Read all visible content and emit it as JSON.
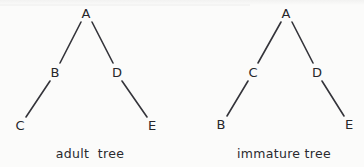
{
  "figure": {
    "background_color": "#fbfbfa",
    "ink_color": "#34343a",
    "text_color": "#26262a",
    "width": 364,
    "height": 167
  },
  "chart_data": {
    "type": "diagram",
    "diagram_kind": "binary-tree-pair",
    "title": "",
    "subtitle": "",
    "xlabel": "",
    "ylabel": "",
    "grid": false,
    "legend_position": "none",
    "panels": [
      {
        "id": "adult-tree",
        "caption": "adult  tree",
        "caption_x": 90,
        "caption_y": 153,
        "nodes": [
          {
            "id": "A",
            "label": "A",
            "x": 86,
            "y": 13,
            "depth": 0
          },
          {
            "id": "B",
            "label": "B",
            "x": 55,
            "y": 72,
            "depth": 1
          },
          {
            "id": "D",
            "label": "D",
            "x": 117,
            "y": 72,
            "depth": 1
          },
          {
            "id": "C",
            "label": "C",
            "x": 20,
            "y": 125,
            "depth": 2
          },
          {
            "id": "E",
            "label": "E",
            "x": 152,
            "y": 125,
            "depth": 2
          }
        ],
        "edges": [
          {
            "from": "A",
            "to": "B",
            "x1": 81,
            "y1": 22,
            "x2": 60,
            "y2": 63
          },
          {
            "from": "A",
            "to": "D",
            "x1": 92,
            "y1": 22,
            "x2": 113,
            "y2": 63
          },
          {
            "from": "B",
            "to": "C",
            "x1": 50,
            "y1": 81,
            "x2": 26,
            "y2": 117
          },
          {
            "from": "D",
            "to": "E",
            "x1": 122,
            "y1": 81,
            "x2": 147,
            "y2": 117
          }
        ]
      },
      {
        "id": "immature-tree",
        "caption": "immature tree",
        "caption_x": 284,
        "caption_y": 153,
        "nodes": [
          {
            "id": "A",
            "label": "A",
            "x": 286,
            "y": 13,
            "depth": 0
          },
          {
            "id": "C",
            "label": "C",
            "x": 253,
            "y": 72,
            "depth": 1
          },
          {
            "id": "D",
            "label": "D",
            "x": 317,
            "y": 72,
            "depth": 1
          },
          {
            "id": "B",
            "label": "B",
            "x": 221,
            "y": 124,
            "depth": 2
          },
          {
            "id": "E",
            "label": "E",
            "x": 349,
            "y": 124,
            "depth": 2
          }
        ],
        "edges": [
          {
            "from": "A",
            "to": "C",
            "x1": 281,
            "y1": 22,
            "x2": 258,
            "y2": 63
          },
          {
            "from": "A",
            "to": "D",
            "x1": 292,
            "y1": 22,
            "x2": 313,
            "y2": 63
          },
          {
            "from": "C",
            "to": "B",
            "x1": 248,
            "y1": 81,
            "x2": 227,
            "y2": 116
          },
          {
            "from": "D",
            "to": "E",
            "x1": 322,
            "y1": 81,
            "x2": 344,
            "y2": 116
          }
        ]
      }
    ]
  }
}
